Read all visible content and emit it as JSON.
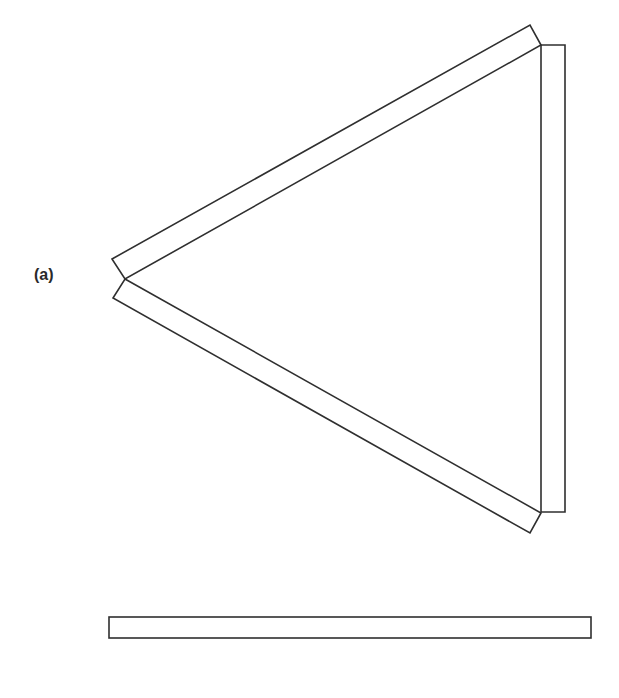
{
  "figure": {
    "label": "(a)",
    "stroke_color": "#2f2f2f",
    "background": "#ffffff",
    "strips": [
      {
        "id": "upper-left-strip",
        "points": [
          [
            112,
            259
          ],
          [
            530,
            25
          ],
          [
            541,
            45
          ],
          [
            125,
            279
          ]
        ]
      },
      {
        "id": "lower-left-strip",
        "points": [
          [
            125,
            279
          ],
          [
            541,
            513
          ],
          [
            530,
            533
          ],
          [
            113,
            298
          ]
        ]
      },
      {
        "id": "right-vertical-strip",
        "points": [
          [
            541,
            45
          ],
          [
            565,
            45
          ],
          [
            565,
            512
          ],
          [
            541,
            512
          ]
        ]
      }
    ],
    "bar": {
      "id": "bottom-bar",
      "x": 109,
      "y": 617,
      "width": 482,
      "height": 21
    }
  }
}
